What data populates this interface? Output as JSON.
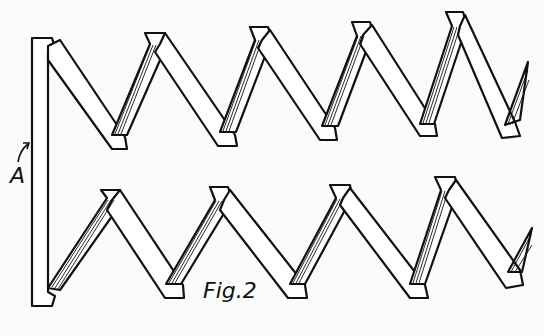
{
  "figure": {
    "caption": "Fig.2",
    "labels": [
      {
        "id": "A",
        "text": "A",
        "description": "arrow pointing to vertical bar"
      }
    ],
    "colors": {
      "ink": "#111111",
      "paper": "#fbfbfb"
    },
    "top_zigzag": {
      "peaks": [
        [
          155,
          32
        ],
        [
          260,
          27
        ],
        [
          360,
          22
        ],
        [
          455,
          12
        ]
      ],
      "valleys": [
        [
          118,
          148
        ],
        [
          225,
          145
        ],
        [
          328,
          138
        ],
        [
          422,
          137
        ]
      ]
    },
    "bottom_zigzag": {
      "peaks": [
        [
          110,
          190
        ],
        [
          220,
          187
        ],
        [
          340,
          185
        ],
        [
          445,
          177
        ]
      ],
      "valleys": [
        [
          50,
          300
        ],
        [
          170,
          298
        ],
        [
          298,
          298
        ],
        [
          418,
          298
        ],
        [
          520,
          285
        ]
      ]
    }
  }
}
